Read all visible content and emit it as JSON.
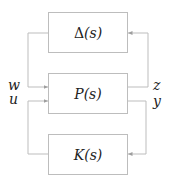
{
  "diagram": {
    "type": "block-diagram",
    "blocks": [
      {
        "id": "delta",
        "symbol": "Δ",
        "arg": "(s)",
        "label": "Δ(s)"
      },
      {
        "id": "plant",
        "symbol": "P",
        "arg": "(s)",
        "label": "P(s)"
      },
      {
        "id": "controller",
        "symbol": "K",
        "arg": "(s)",
        "label": "K(s)"
      }
    ],
    "signals": {
      "w": "w",
      "u": "u",
      "z": "z",
      "y": "y"
    },
    "connections": [
      {
        "from": "delta",
        "to": "plant",
        "signal": "w"
      },
      {
        "from": "plant",
        "to": "delta",
        "signal": "z"
      },
      {
        "from": "plant",
        "to": "controller",
        "signal": "y"
      },
      {
        "from": "controller",
        "to": "plant",
        "signal": "u"
      }
    ],
    "colors": {
      "line": "#bdbdbd",
      "text": "#222222",
      "background": "#ffffff"
    }
  }
}
